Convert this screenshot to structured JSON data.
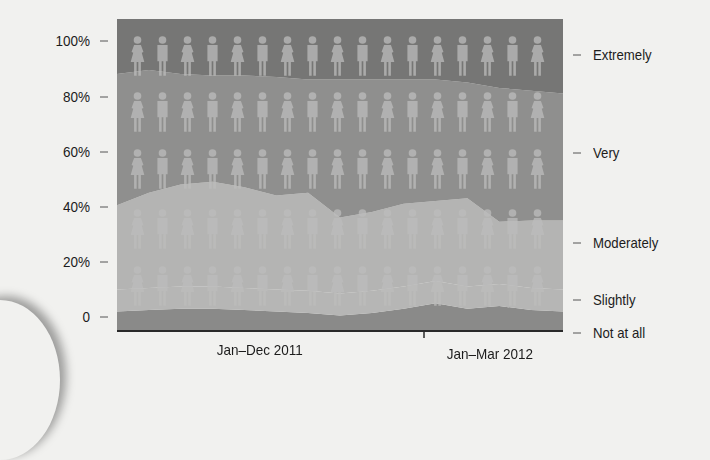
{
  "chart_data": {
    "type": "area",
    "stacked": true,
    "normalized": true,
    "title": "",
    "xlabel": "",
    "ylabel": "",
    "ylim": [
      0,
      100
    ],
    "y_ticks": [
      "100%",
      "80%",
      "60%",
      "40%",
      "20%",
      "0"
    ],
    "x_ticks": [
      "Jan–Dec 2011",
      "Jan–Mar 2012"
    ],
    "x": [
      0,
      1,
      2,
      3,
      4,
      5,
      6,
      7,
      8,
      9,
      10,
      11,
      12,
      13,
      14
    ],
    "series": [
      {
        "name": "Not at all",
        "values": [
          2,
          2.5,
          3,
          3,
          2.5,
          2,
          1.5,
          0.5,
          1.5,
          3,
          5,
          3,
          4,
          2.5,
          2
        ]
      },
      {
        "name": "Slightly",
        "values": [
          8,
          8,
          8,
          8,
          8,
          8,
          8,
          8,
          8,
          8,
          8,
          8,
          8,
          8,
          8
        ]
      },
      {
        "name": "Moderately",
        "values": [
          30.5,
          34.5,
          37,
          38,
          36.5,
          34,
          35.5,
          27.5,
          28.5,
          30,
          29,
          32,
          22.5,
          24.5,
          25
        ]
      },
      {
        "name": "Very",
        "values": [
          47.5,
          44.5,
          40,
          38.5,
          40.5,
          43,
          41,
          50,
          48,
          45,
          44,
          42,
          48.5,
          47,
          46
        ]
      },
      {
        "name": "Extremely",
        "values": [
          12,
          10.5,
          12,
          12.5,
          12.5,
          13,
          14,
          14,
          14,
          14,
          14,
          15,
          17,
          18,
          19
        ]
      }
    ],
    "legend_position": "right (inline labels)",
    "grid": false,
    "decoration": "pictogram rows of alternating female/male figures (5 rows × 17)"
  },
  "axes": {
    "y_labels": [
      "100%",
      "80%",
      "60%",
      "40%",
      "20%",
      "0"
    ],
    "x_labels": [
      "Jan–Dec 2011",
      "Jan–Mar 2012"
    ]
  },
  "legend": {
    "labels": [
      "Extremely",
      "Very",
      "Moderately",
      "Slightly",
      "Not at all"
    ]
  },
  "colors": {
    "extremely": "#767675",
    "very": "#8f8f8e",
    "moderately": "#b4b4b3",
    "slightly": "#b6b6b5",
    "not_at_all": "#8a8a89",
    "figure": "#bdbdbc",
    "axis": "#2a2a2a",
    "background": "#f1f1ef"
  }
}
